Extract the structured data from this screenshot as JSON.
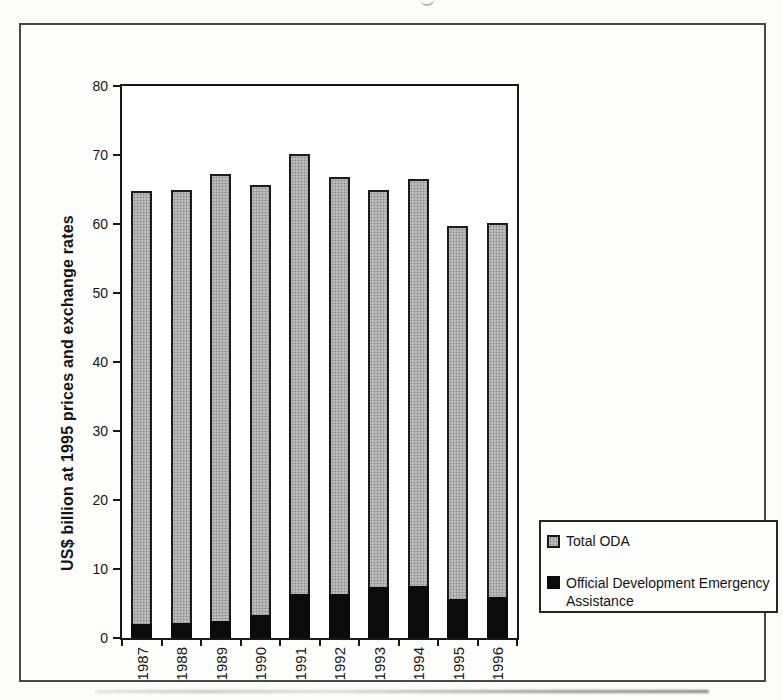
{
  "chart_data": {
    "type": "bar",
    "bar_style": "overlay",
    "title": "",
    "xlabel": "",
    "ylabel": "US$ billion at 1995 prices and exchange rates",
    "ylim": [
      0,
      80
    ],
    "yticks": [
      0,
      10,
      20,
      30,
      40,
      50,
      60,
      70,
      80
    ],
    "grid": false,
    "legend_position": "right",
    "categories": [
      "1987",
      "1988",
      "1989",
      "1990",
      "1991",
      "1992",
      "1993",
      "1994",
      "1995",
      "1996"
    ],
    "series": [
      {
        "name": "Total ODA",
        "color": "#bcbcbc",
        "values": [
          64.8,
          65.0,
          67.2,
          65.6,
          70.2,
          66.8,
          64.9,
          66.5,
          59.7,
          60.1
        ]
      },
      {
        "name": "Official Development Emergency Assistance",
        "color": "#0b0b0b",
        "values": [
          2.1,
          2.2,
          2.5,
          3.3,
          6.4,
          6.4,
          7.4,
          7.5,
          5.7,
          6.0
        ]
      }
    ]
  },
  "legend": {
    "items": [
      {
        "label": "Total ODA",
        "color": "#bcbcbc"
      },
      {
        "label": "Official Development Emergency Assistance",
        "color": "#0b0b0b"
      }
    ]
  }
}
